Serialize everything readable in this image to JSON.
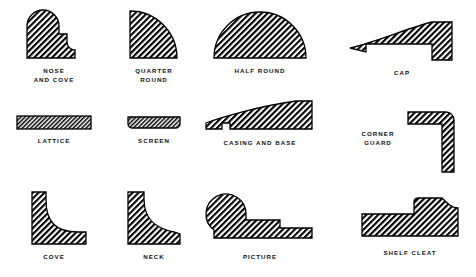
{
  "figure": {
    "style": {
      "ink": "#000000",
      "paper": "#ffffff",
      "hatch": "#000000",
      "outline_width": 1.2,
      "hatch_angle_deg": 45,
      "hatch_spacing_px": 2.2
    },
    "columns": 4,
    "rows": 3
  },
  "shapes": [
    {
      "id": "nose-and-cove",
      "label": "NOSE\nAND COVE",
      "row": 1,
      "col": 1,
      "profile": "rounded bullnose top-left with stepped cove notch at right",
      "x": 14,
      "y": 6,
      "w": 62,
      "h": 52
    },
    {
      "id": "quarter-round",
      "label": "QUARTER\nROUND",
      "row": 1,
      "col": 2,
      "profile": "quarter circle, convex arc from top-left to bottom-right",
      "x": 126,
      "y": 6,
      "w": 52,
      "h": 52
    },
    {
      "id": "half-round",
      "label": "HALF ROUND",
      "row": 1,
      "col": 3,
      "profile": "semicircular dome on flat base",
      "x": 214,
      "y": 12,
      "w": 92,
      "h": 46
    },
    {
      "id": "cap",
      "label": "CAP",
      "row": 1,
      "col": 4,
      "profile": "tapered curved top with square drop leg at right",
      "x": 352,
      "y": 24,
      "w": 100,
      "h": 40
    },
    {
      "id": "lattice",
      "label": "LATTICE",
      "row": 2,
      "col": 1,
      "profile": "thin wide rectangle",
      "x": 15,
      "y": 116,
      "w": 72,
      "h": 13
    },
    {
      "id": "screen",
      "label": "SCREEN",
      "row": 2,
      "col": 2,
      "profile": "thin bar with chamfered lower corners",
      "x": 124,
      "y": 118,
      "w": 50,
      "h": 11
    },
    {
      "id": "casing-and-base",
      "label": "CASING AND BASE",
      "row": 2,
      "col": 3,
      "profile": "long wedge tapering to the left with a relief notch at lower left",
      "x": 205,
      "y": 101,
      "w": 110,
      "h": 30
    },
    {
      "id": "corner-guard",
      "label": "CORNER\nGUARD",
      "row": 2,
      "col": 4,
      "profile": "L-shaped angle with rounded outer corner",
      "x": 378,
      "y": 113,
      "w": 62,
      "h": 62
    },
    {
      "id": "cove",
      "label": "COVE",
      "row": 3,
      "col": 1,
      "profile": "L-shape with concave quarter-hollow inner curve",
      "x": 25,
      "y": 192,
      "w": 56,
      "h": 56
    },
    {
      "id": "neck",
      "label": "NECK",
      "row": 3,
      "col": 2,
      "profile": "block with ogee S-curve on the right face",
      "x": 133,
      "y": 192,
      "w": 58,
      "h": 56
    },
    {
      "id": "picture",
      "label": "PICTURE",
      "row": 3,
      "col": 3,
      "profile": "large round bead at left with stepped flat body at right",
      "x": 221,
      "y": 195,
      "w": 104,
      "h": 52
    },
    {
      "id": "shelf-cleat",
      "label": "SHELF CLEAT",
      "row": 3,
      "col": 4,
      "profile": "flat rail with raised stepped block at right",
      "x": 362,
      "y": 200,
      "w": 92,
      "h": 42
    }
  ]
}
